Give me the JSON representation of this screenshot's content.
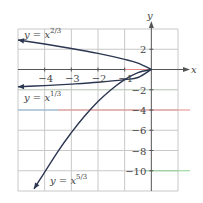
{
  "chart_data": {
    "type": "line",
    "title": "",
    "xlabel": "x",
    "ylabel": "y",
    "xlim": [
      -5,
      1
    ],
    "ylim": [
      -12,
      4
    ],
    "grid": true,
    "x_ticks": [
      -4,
      -3,
      -2,
      -1
    ],
    "x_tick_labels": [
      "−4",
      "−3",
      "−2",
      "−1"
    ],
    "y_ticks": [
      2,
      -2,
      -4,
      -6,
      -8,
      -10
    ],
    "y_tick_labels": [
      "2",
      "−2",
      "−4",
      "−6",
      "−8",
      "−10"
    ],
    "series": [
      {
        "name": "y = x^(2/3)",
        "label_base": "y = x",
        "label_exp": "2/3",
        "x": [
          0,
          -0.5,
          -1,
          -2,
          -3,
          -4,
          -5
        ],
        "y": [
          0,
          0.63,
          1.0,
          1.59,
          2.08,
          2.52,
          2.92
        ],
        "arrow": "left"
      },
      {
        "name": "y = x^(1/3)",
        "label_base": "y = x",
        "label_exp": "1/3",
        "x": [
          0,
          -0.5,
          -1,
          -2,
          -3,
          -4,
          -5
        ],
        "y": [
          0,
          -0.79,
          -1.0,
          -1.26,
          -1.44,
          -1.59,
          -1.71
        ],
        "arrow": "left"
      },
      {
        "name": "y = x^(5/3)",
        "label_base": "y = x",
        "label_exp": "5/3",
        "x": [
          0,
          -0.5,
          -1,
          -1.5,
          -2,
          -2.5,
          -3,
          -3.5,
          -4.4
        ],
        "y": [
          0,
          -0.31,
          -1.0,
          -1.97,
          -3.17,
          -4.6,
          -6.24,
          -8.08,
          -11.8
        ],
        "arrow": "down"
      }
    ],
    "colors": {
      "curve": "#2b3650",
      "grid": "#c8c8c8",
      "axis": "#555555",
      "tint_red": "#e58a8a",
      "tint_blue": "#8ab8d8",
      "tint_green": "#8fd08f"
    }
  }
}
